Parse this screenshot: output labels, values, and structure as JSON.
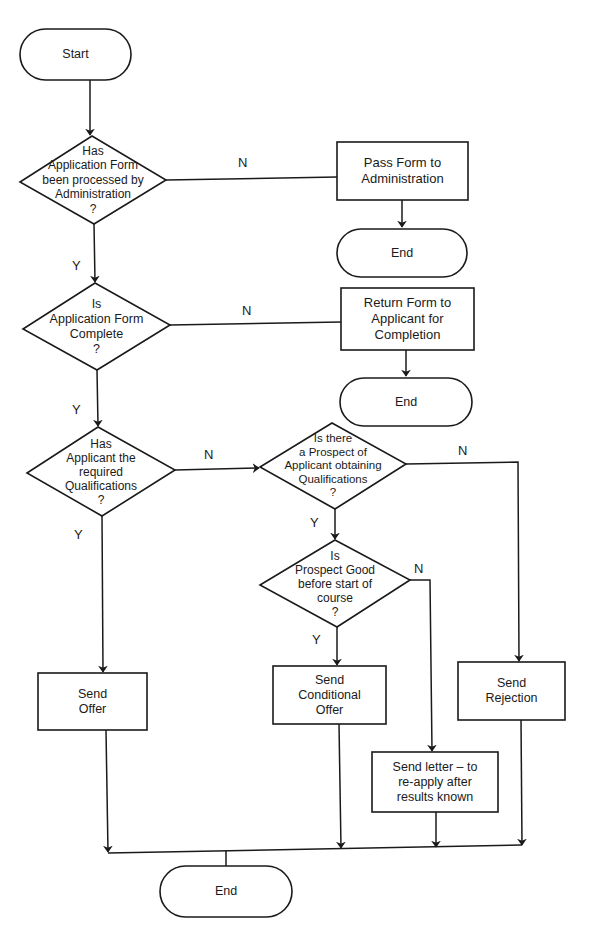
{
  "diagram": {
    "type": "flowchart",
    "nodes": {
      "start": {
        "shape": "terminator",
        "label": "Start"
      },
      "q_processed": {
        "shape": "decision",
        "label": "Has\nApplication Form\nbeen processed by\nAdministration\n?"
      },
      "pass_form": {
        "shape": "process",
        "label": "Pass Form to\nAdministration"
      },
      "end_1": {
        "shape": "terminator",
        "label": "End"
      },
      "q_complete": {
        "shape": "decision",
        "label": "Is\nApplication Form\nComplete\n?"
      },
      "return_form": {
        "shape": "process",
        "label": "Return Form to\nApplicant for\nCompletion"
      },
      "end_2": {
        "shape": "terminator",
        "label": "End"
      },
      "q_qualifications": {
        "shape": "decision",
        "label": "Has\nApplicant the\nrequired\nQualifications\n?"
      },
      "q_prospect": {
        "shape": "decision",
        "label": "Is there\na Prospect of\nApplicant obtaining\nQualifications\n?"
      },
      "q_prospect_good": {
        "shape": "decision",
        "label": "Is\nProspect Good\nbefore start of\ncourse\n?"
      },
      "send_offer": {
        "shape": "process",
        "label": "Send\nOffer"
      },
      "send_conditional": {
        "shape": "process",
        "label": "Send\nConditional\nOffer"
      },
      "send_rejection": {
        "shape": "process",
        "label": "Send\nRejection"
      },
      "send_letter": {
        "shape": "process",
        "label": "Send letter  –  to\nre-apply after\nresults known"
      },
      "end_3": {
        "shape": "terminator",
        "label": "End"
      }
    },
    "edges": [
      {
        "from": "start",
        "to": "q_processed",
        "label": ""
      },
      {
        "from": "q_processed",
        "to": "pass_form",
        "label": "N"
      },
      {
        "from": "pass_form",
        "to": "end_1",
        "label": ""
      },
      {
        "from": "q_processed",
        "to": "q_complete",
        "label": "Y"
      },
      {
        "from": "q_complete",
        "to": "return_form",
        "label": "N"
      },
      {
        "from": "return_form",
        "to": "end_2",
        "label": ""
      },
      {
        "from": "q_complete",
        "to": "q_qualifications",
        "label": "Y"
      },
      {
        "from": "q_qualifications",
        "to": "q_prospect",
        "label": "N"
      },
      {
        "from": "q_qualifications",
        "to": "send_offer",
        "label": "Y"
      },
      {
        "from": "q_prospect",
        "to": "send_rejection",
        "label": "N"
      },
      {
        "from": "q_prospect",
        "to": "q_prospect_good",
        "label": "Y"
      },
      {
        "from": "q_prospect_good",
        "to": "send_conditional",
        "label": "Y"
      },
      {
        "from": "q_prospect_good",
        "to": "send_letter",
        "label": "N"
      },
      {
        "from": "send_offer",
        "to": "end_3",
        "label": ""
      },
      {
        "from": "send_conditional",
        "to": "end_3",
        "label": ""
      },
      {
        "from": "send_letter",
        "to": "end_3",
        "label": ""
      },
      {
        "from": "send_rejection",
        "to": "end_3",
        "label": ""
      }
    ],
    "edge_labels": {
      "yes": "Y",
      "no": "N"
    }
  }
}
